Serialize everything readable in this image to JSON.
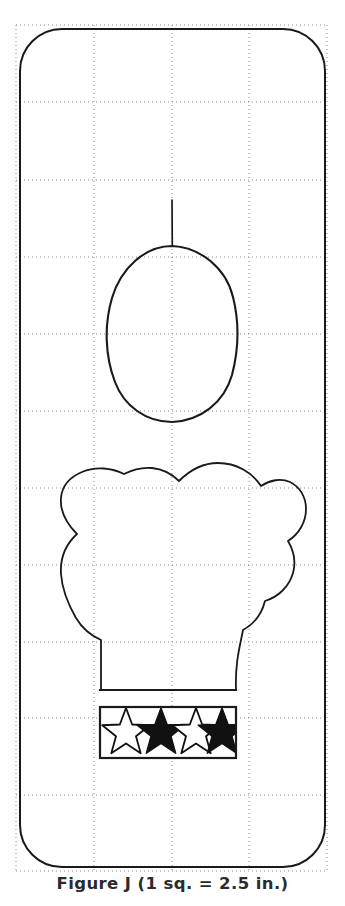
{
  "figure": {
    "id": "Figure J",
    "caption": "Figure J (1 sq.  =  2.5 in.)",
    "scale_note": "1 sq. = 2.5 in.",
    "scale_square_inches": 2.5,
    "background_color": "#ffffff",
    "ink_color": "#1a1a1a",
    "grid_color": "#8c8c8c"
  },
  "grid": {
    "visible": true,
    "style": "dotted",
    "columns": 4,
    "rows": 11,
    "cell_width_px": 77.8,
    "cell_height_px": 76.9,
    "x_lines": [
      16,
      94,
      172,
      249,
      327
    ],
    "y_lines": [
      25,
      102,
      180,
      257,
      334,
      411,
      488,
      565,
      642,
      718,
      795,
      871
    ],
    "color": "#8c8c8c",
    "dash": "1 3"
  },
  "shapes": {
    "outer_panel": {
      "name": "rounded-pattern-outline",
      "x": 20,
      "y": 29,
      "width": 305,
      "height": 838,
      "corner_radius": 42,
      "stroke": "#1a1a1a",
      "stroke_width": 2,
      "fill": "none"
    },
    "hat_stem": {
      "name": "hat-top-stem",
      "x": 172,
      "y_top": 200,
      "y_bottom": 246,
      "stroke_width": 1.6
    },
    "head_circle": {
      "name": "head-outline",
      "center_x": 172,
      "center_y": 333,
      "radius_x": 64,
      "radius_y": 88,
      "stroke_width": 2
    },
    "chef_hat": {
      "name": "chef-hat-outline",
      "top_y": 466,
      "bottom_y": 690,
      "left_x": 60,
      "right_x": 285,
      "stroke_width": 1.8
    },
    "hat_brim_line": {
      "name": "hat-brim-line",
      "x1": 100,
      "x2": 236,
      "y": 690,
      "stroke_width": 2
    },
    "star_band": {
      "name": "star-headband",
      "x": 100,
      "y": 707,
      "width": 136,
      "height": 51,
      "stroke": "#1a1a1a",
      "stroke_width": 2.2,
      "fill": "#ffffff"
    }
  },
  "stars": [
    {
      "index": 1,
      "label": "star-outline-1",
      "fill": "none",
      "cx": 126,
      "cy": 733,
      "outer_r": 25,
      "inner_r": 10.5
    },
    {
      "index": 2,
      "label": "star-filled-2",
      "fill": "#111111",
      "cx": 161,
      "cy": 733,
      "outer_r": 25,
      "inner_r": 10.5
    },
    {
      "index": 3,
      "label": "star-outline-3",
      "fill": "none",
      "cx": 196,
      "cy": 733,
      "outer_r": 25,
      "inner_r": 10.5
    },
    {
      "index": 4,
      "label": "star-filled-4",
      "fill": "#111111",
      "cx": 222,
      "cy": 733,
      "outer_r": 25,
      "inner_r": 10.5
    }
  ]
}
